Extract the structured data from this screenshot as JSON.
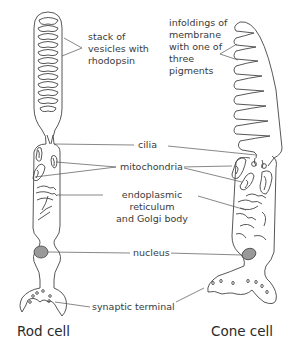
{
  "diagram": {
    "type": "labeled biological illustration",
    "cells": [
      {
        "id": "rod",
        "title": "Rod cell"
      },
      {
        "id": "cone",
        "title": "Cone cell"
      }
    ],
    "labels": {
      "rod_outer_segment": "stack of\nvesicles with\nrhodopsin",
      "cone_outer_segment": "infoldings of\nmembrane\nwith one of\nthree\npigments",
      "cilia": "cilia",
      "mitochondria": "mitochondria",
      "er_golgi": "endoplasmic reticulum\nand Golgi body",
      "nucleus": "nucleus",
      "synaptic_terminal": "synaptic terminal"
    },
    "colors": {
      "outline": "#444444",
      "nucleus_fill": "#999999",
      "text": "#3a3a3a",
      "background": "#ffffff"
    }
  }
}
